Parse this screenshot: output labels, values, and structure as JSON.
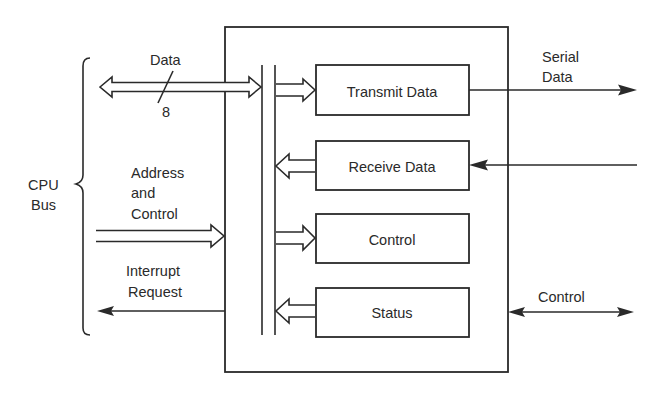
{
  "diagram": {
    "cpu_bus": {
      "line1": "CPU",
      "line2": "Bus"
    },
    "left_signals": {
      "data": {
        "label": "Data",
        "width": "8"
      },
      "address_control": {
        "line1": "Address",
        "line2": "and",
        "line3": "Control"
      },
      "interrupt": {
        "line1": "Interrupt",
        "line2": "Request"
      }
    },
    "registers": [
      {
        "label": "Transmit Data",
        "direction": "in"
      },
      {
        "label": "Receive Data",
        "direction": "out"
      },
      {
        "label": "Control",
        "direction": "in"
      },
      {
        "label": "Status",
        "direction": "out"
      }
    ],
    "right_signals": {
      "serial": {
        "line1": "Serial",
        "line2": "Data"
      },
      "control": {
        "label": "Control"
      }
    },
    "colors": {
      "ink": "#2a2a2a",
      "paper": "#ffffff"
    }
  }
}
